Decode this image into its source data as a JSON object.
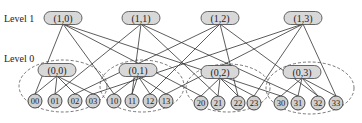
{
  "diagram": {
    "level_labels": [
      {
        "id": "level1",
        "text": "Level 1",
        "x": 4,
        "y": 22
      },
      {
        "id": "level0",
        "text": "Level 0",
        "x": 4,
        "y": 62
      }
    ],
    "level1_nodes": [
      {
        "id": "1,0",
        "label": "(1,0)",
        "x": 63,
        "y": 18
      },
      {
        "id": "1,1",
        "label": "(1,1)",
        "x": 141,
        "y": 18
      },
      {
        "id": "1,2",
        "label": "(1,2)",
        "x": 220,
        "y": 18
      },
      {
        "id": "1,3",
        "label": "(1,3)",
        "x": 303,
        "y": 18
      }
    ],
    "level0_nodes": [
      {
        "id": "0,0",
        "label": "(0,0)",
        "x": 57,
        "y": 70
      },
      {
        "id": "0,1",
        "label": "(0,1)",
        "x": 138,
        "y": 70
      },
      {
        "id": "0,2",
        "label": "(0,2)",
        "x": 220,
        "y": 72
      },
      {
        "id": "0,3",
        "label": "(0,3)",
        "x": 302,
        "y": 72
      }
    ],
    "groups": [
      {
        "id": "g0",
        "cx": 63,
        "cy": 86,
        "rx": 44,
        "ry": 26
      },
      {
        "id": "g1",
        "cx": 142,
        "cy": 86,
        "rx": 42,
        "ry": 26
      },
      {
        "id": "g2",
        "cx": 228,
        "cy": 88,
        "rx": 42,
        "ry": 24
      },
      {
        "id": "g3",
        "cx": 310,
        "cy": 88,
        "rx": 44,
        "ry": 26
      }
    ],
    "leaves": [
      {
        "id": "00",
        "label": "00",
        "x": 35,
        "y": 101
      },
      {
        "id": "01",
        "label": "01",
        "x": 55,
        "y": 101
      },
      {
        "id": "02",
        "label": "02",
        "x": 75,
        "y": 101
      },
      {
        "id": "03",
        "label": "03",
        "x": 93,
        "y": 101
      },
      {
        "id": "10",
        "label": "10",
        "x": 114,
        "y": 101
      },
      {
        "id": "11",
        "label": "11",
        "x": 132,
        "y": 101
      },
      {
        "id": "12",
        "label": "12",
        "x": 150,
        "y": 101
      },
      {
        "id": "13",
        "label": "13",
        "x": 166,
        "y": 101
      },
      {
        "id": "20",
        "label": "20",
        "x": 201,
        "y": 103
      },
      {
        "id": "21",
        "label": "21",
        "x": 218,
        "y": 103
      },
      {
        "id": "22",
        "label": "22",
        "x": 238,
        "y": 103
      },
      {
        "id": "23",
        "label": "23",
        "x": 254,
        "y": 103
      },
      {
        "id": "30",
        "label": "30",
        "x": 281,
        "y": 103
      },
      {
        "id": "31",
        "label": "31",
        "x": 298,
        "y": 103
      },
      {
        "id": "32",
        "label": "32",
        "x": 318,
        "y": 103
      },
      {
        "id": "33",
        "label": "33",
        "x": 336,
        "y": 103
      }
    ],
    "edges": [
      [
        "1,0",
        "00"
      ],
      [
        "1,0",
        "10"
      ],
      [
        "1,0",
        "20"
      ],
      [
        "1,0",
        "30"
      ],
      [
        "1,1",
        "01"
      ],
      [
        "1,1",
        "11"
      ],
      [
        "1,1",
        "21"
      ],
      [
        "1,1",
        "31"
      ],
      [
        "1,2",
        "02"
      ],
      [
        "1,2",
        "12"
      ],
      [
        "1,2",
        "22"
      ],
      [
        "1,2",
        "32"
      ],
      [
        "1,3",
        "03"
      ],
      [
        "1,3",
        "13"
      ],
      [
        "1,3",
        "23"
      ],
      [
        "1,3",
        "33"
      ],
      [
        "0,0",
        "00"
      ],
      [
        "0,0",
        "01"
      ],
      [
        "0,0",
        "02"
      ],
      [
        "0,0",
        "03"
      ],
      [
        "0,1",
        "10"
      ],
      [
        "0,1",
        "11"
      ],
      [
        "0,1",
        "12"
      ],
      [
        "0,1",
        "13"
      ],
      [
        "0,2",
        "20"
      ],
      [
        "0,2",
        "21"
      ],
      [
        "0,2",
        "22"
      ],
      [
        "0,2",
        "23"
      ],
      [
        "0,3",
        "30"
      ],
      [
        "0,3",
        "31"
      ],
      [
        "0,3",
        "32"
      ],
      [
        "0,3",
        "33"
      ]
    ]
  }
}
